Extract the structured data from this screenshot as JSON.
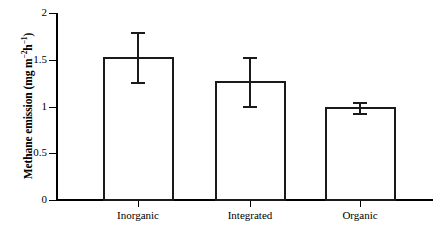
{
  "chart_data": {
    "type": "bar",
    "title": "",
    "subtitle": "",
    "xlabel": "",
    "ylabel": "Methane emission (mg m⁻²h⁻¹)",
    "ylabel_parts": {
      "main": "Methane emission (mg m",
      "sup1": "−2",
      "mid": "h",
      "sup2": "−1",
      "end": ")"
    },
    "categories": [
      "Inorganic",
      "Integrated",
      "Organic"
    ],
    "values": [
      1.53,
      1.27,
      0.99
    ],
    "errors": [
      0.27,
      0.26,
      0.06
    ],
    "error_type": "standard error bars",
    "ylim": [
      0,
      2
    ],
    "yticks": [
      0,
      0.5,
      1,
      1.5,
      2
    ],
    "ytick_labels": [
      "0",
      "0.5",
      "1",
      "1.5",
      "2"
    ],
    "grid": false,
    "legend": false,
    "legend_position": "none",
    "bar_fill": "#ffffff",
    "bar_outline": "#1a1a1a",
    "axis_color": "#000000"
  },
  "figure": {
    "background": "#ffffff",
    "width": 443,
    "height": 235
  }
}
